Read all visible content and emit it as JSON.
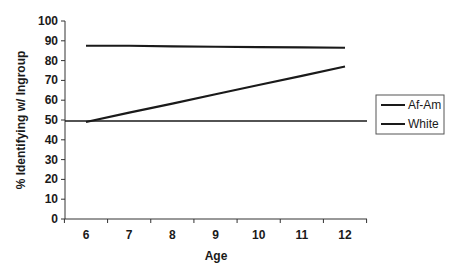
{
  "chart_data": {
    "type": "line",
    "title": "",
    "xlabel": "Age",
    "ylabel": "% Identifying w/ Ingroup",
    "x": [
      6,
      7,
      8,
      9,
      10,
      11,
      12
    ],
    "ylim": [
      0,
      100
    ],
    "yticks": [
      0,
      10,
      20,
      30,
      40,
      50,
      60,
      70,
      80,
      90,
      100
    ],
    "xticks": [
      "6",
      "7",
      "8",
      "9",
      "10",
      "11",
      "12"
    ],
    "grid": false,
    "legend_position": "right",
    "series": [
      {
        "name": "Af-Am",
        "values": [
          49,
          53.7,
          58.3,
          63,
          67.7,
          72.3,
          77
        ]
      },
      {
        "name": "White",
        "values": [
          87.5,
          87.5,
          87.2,
          87,
          86.8,
          86.7,
          86.5
        ]
      }
    ],
    "reference_lines": [
      {
        "y": 50,
        "label": ""
      }
    ]
  },
  "legend": {
    "items": [
      {
        "label": "Af-Am"
      },
      {
        "label": "White"
      }
    ]
  },
  "colors": {
    "line": "#1a1a1a",
    "axis": "#333333",
    "background": "#ffffff"
  }
}
